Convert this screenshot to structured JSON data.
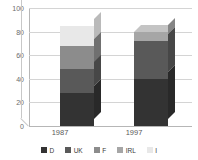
{
  "chart_data": {
    "type": "bar",
    "subtype": "stacked-column-3d",
    "title": "",
    "xlabel": "",
    "ylabel": "",
    "ylim": [
      0,
      100
    ],
    "yticks": [
      0,
      20,
      40,
      60,
      80,
      100
    ],
    "ytick_labels": [
      "0",
      "20",
      "40",
      "60",
      "80",
      "100"
    ],
    "grid": true,
    "grid_axis": "y",
    "legend_position": "bottom",
    "categories": [
      "1987",
      "1997"
    ],
    "series": [
      {
        "name": "D",
        "color": "#333333",
        "values": [
          28,
          40
        ]
      },
      {
        "name": "UK",
        "color": "#595959",
        "values": [
          20,
          32
        ]
      },
      {
        "name": "F",
        "color": "#8c8c8c",
        "values": [
          20,
          0
        ]
      },
      {
        "name": "IRL",
        "color": "#a6a6a6",
        "values": [
          0,
          8
        ]
      },
      {
        "name": "I",
        "color": "#e8e8e8",
        "values": [
          17,
          0
        ]
      }
    ],
    "totals": [
      85,
      80
    ]
  },
  "legend": {
    "items": [
      {
        "label": "D",
        "color": "#333333"
      },
      {
        "label": "UK",
        "color": "#595959"
      },
      {
        "label": "F",
        "color": "#8c8c8c"
      },
      {
        "label": "IRL",
        "color": "#a6a6a6"
      },
      {
        "label": "I",
        "color": "#e8e8e8"
      }
    ]
  },
  "axis": {
    "y_labels": [
      "100",
      "80",
      "60",
      "40",
      "20",
      "0"
    ]
  },
  "colors": {
    "gridline": "#d4d4d4",
    "axis": "#b6b6b6",
    "background": "#ffffff",
    "tick_text": "#6b6b6b",
    "category_text": "#5a5a5a"
  }
}
